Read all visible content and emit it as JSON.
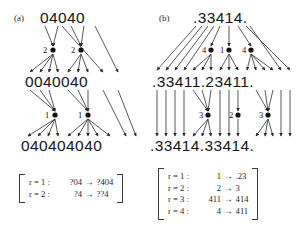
{
  "figure": {
    "type": "derivation-diagram",
    "background_color": "#ffffff",
    "ink_color": "#151515"
  },
  "panels": [
    {
      "id": "a",
      "label": "(a)",
      "strings": [
        {
          "id": "a-top",
          "text": "04040",
          "row": "top"
        },
        {
          "id": "a-middle",
          "text": "0040040",
          "row": "middle"
        },
        {
          "id": "a-bottom",
          "text": "040404040",
          "row": "bottom"
        }
      ],
      "node_rows": [
        {
          "id": "a-nodes-1",
          "labels": [
            "2",
            "2"
          ]
        },
        {
          "id": "a-nodes-2",
          "labels": [
            "1",
            "1"
          ]
        }
      ],
      "rulebox": {
        "id": "rulebox-a",
        "rules": [
          {
            "name": "r = 1 :",
            "lhs": "?04",
            "arrow": "→",
            "rhs": "?404"
          },
          {
            "name": "r = 2 :",
            "lhs": "?4",
            "arrow": "→",
            "rhs": "??4"
          }
        ]
      }
    },
    {
      "id": "b",
      "label": "(b)",
      "strings": [
        {
          "id": "b-top",
          "text": ".33414.",
          "row": "top"
        },
        {
          "id": "b-middle",
          "text": ".33411.23411.",
          "row": "middle"
        },
        {
          "id": "b-bottom",
          "text": ".33414.33414.",
          "row": "bottom"
        }
      ],
      "node_rows": [
        {
          "id": "b-nodes-1",
          "labels": [
            "4",
            "1",
            "4"
          ]
        },
        {
          "id": "b-nodes-2",
          "labels": [
            "3",
            "2",
            "3"
          ]
        }
      ],
      "rulebox": {
        "id": "rulebox-b",
        "rules": [
          {
            "name": "r = 1 :",
            "lhs": "1",
            "arrow": "→",
            "rhs": ".23"
          },
          {
            "name": "r = 2 :",
            "lhs": "2",
            "arrow": "→",
            "rhs": "3"
          },
          {
            "name": "r = 3 :",
            "lhs": "411",
            "arrow": "→",
            "rhs": "414"
          },
          {
            "name": "r = 4 :",
            "lhs": "4",
            "arrow": "→",
            "rhs": "411"
          }
        ]
      }
    }
  ]
}
